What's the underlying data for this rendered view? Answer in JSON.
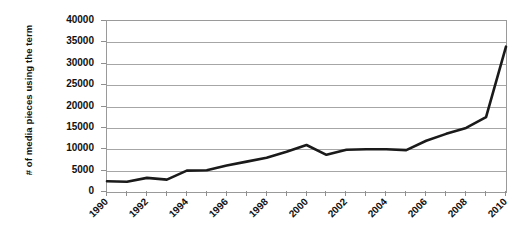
{
  "chart_data": {
    "type": "line",
    "title": "",
    "xlabel": "",
    "ylabel": "# of media pieces using the term",
    "xlim": [
      1990,
      2010
    ],
    "ylim": [
      0,
      40000
    ],
    "grid": true,
    "legend": false,
    "legend_position": "none",
    "series_color": "#1a1a1a",
    "axis_color": "#9a9a9a",
    "gridline_color": "#a6a6a6",
    "y_ticks": [
      0,
      5000,
      10000,
      15000,
      20000,
      25000,
      30000,
      35000,
      40000
    ],
    "y_tick_labels": [
      "0",
      "5000",
      "10000",
      "15000",
      "20000",
      "25000",
      "30000",
      "35000",
      "40000"
    ],
    "x_ticks": [
      1990,
      1991,
      1992,
      1993,
      1994,
      1995,
      1996,
      1997,
      1998,
      1999,
      2000,
      2001,
      2002,
      2003,
      2004,
      2005,
      2006,
      2007,
      2008,
      2009,
      2010
    ],
    "x_tick_labels_shown": [
      "1990",
      "1992",
      "1994",
      "1996",
      "1998",
      "2000",
      "2002",
      "2004",
      "2006",
      "2008",
      "2010"
    ],
    "x_tick_label_interval": 2,
    "x": [
      1990,
      1991,
      1992,
      1993,
      1994,
      1995,
      1996,
      1997,
      1998,
      1999,
      2000,
      2001,
      2002,
      2003,
      2004,
      2005,
      2006,
      2007,
      2008,
      2009,
      2010
    ],
    "values": [
      2500,
      2400,
      3300,
      2900,
      5000,
      5100,
      6200,
      7100,
      8000,
      9400,
      11000,
      8700,
      9900,
      10000,
      10000,
      9800,
      12000,
      13600,
      15000,
      17500,
      34000
    ],
    "series": [
      {
        "name": "# of media pieces using the term",
        "values": [
          2500,
          2400,
          3300,
          2900,
          5000,
          5100,
          6200,
          7100,
          8000,
          9400,
          11000,
          8700,
          9900,
          10000,
          10000,
          9800,
          12000,
          13600,
          15000,
          17500,
          34000
        ]
      }
    ]
  }
}
